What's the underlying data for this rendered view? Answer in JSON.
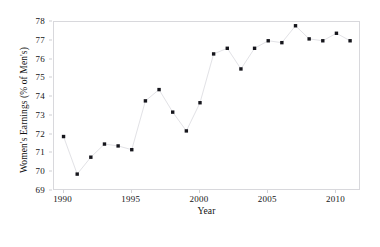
{
  "chart_data": {
    "type": "line",
    "title": "",
    "xlabel": "Year",
    "ylabel": "Women's Earnings (% of Men's)",
    "xlim": [
      1989.3,
      2011.8
    ],
    "ylim": [
      69,
      78
    ],
    "xticks": [
      1990,
      1995,
      2000,
      2005,
      2010
    ],
    "xtick_labels": [
      "1990",
      "1995",
      "2000",
      "2005",
      "2010"
    ],
    "yticks": [
      69,
      70,
      71,
      72,
      73,
      74,
      75,
      76,
      77,
      78
    ],
    "ytick_labels": [
      "69",
      "70",
      "71",
      "72",
      "73",
      "74",
      "75",
      "76",
      "77",
      "78"
    ],
    "grid": false,
    "legend": null,
    "marker": "filled-square",
    "marker_color": "#16161c",
    "line_color": "#e2e2e6",
    "x": [
      1990,
      1991,
      1992,
      1993,
      1994,
      1995,
      1996,
      1997,
      1998,
      1999,
      2000,
      2001,
      2002,
      2003,
      2004,
      2005,
      2006,
      2007,
      2008,
      2009,
      2010,
      2011
    ],
    "values": [
      71.9,
      69.9,
      70.8,
      71.5,
      71.4,
      71.2,
      73.8,
      74.4,
      73.2,
      72.2,
      73.7,
      76.3,
      76.6,
      75.5,
      76.6,
      77.0,
      76.9,
      77.8,
      77.1,
      77.0,
      77.4,
      77.0
    ],
    "categories": [
      "1990",
      "1991",
      "1992",
      "1993",
      "1994",
      "1995",
      "1996",
      "1997",
      "1998",
      "1999",
      "2000",
      "2001",
      "2002",
      "2003",
      "2004",
      "2005",
      "2006",
      "2007",
      "2008",
      "2009",
      "2010",
      "2011"
    ]
  }
}
